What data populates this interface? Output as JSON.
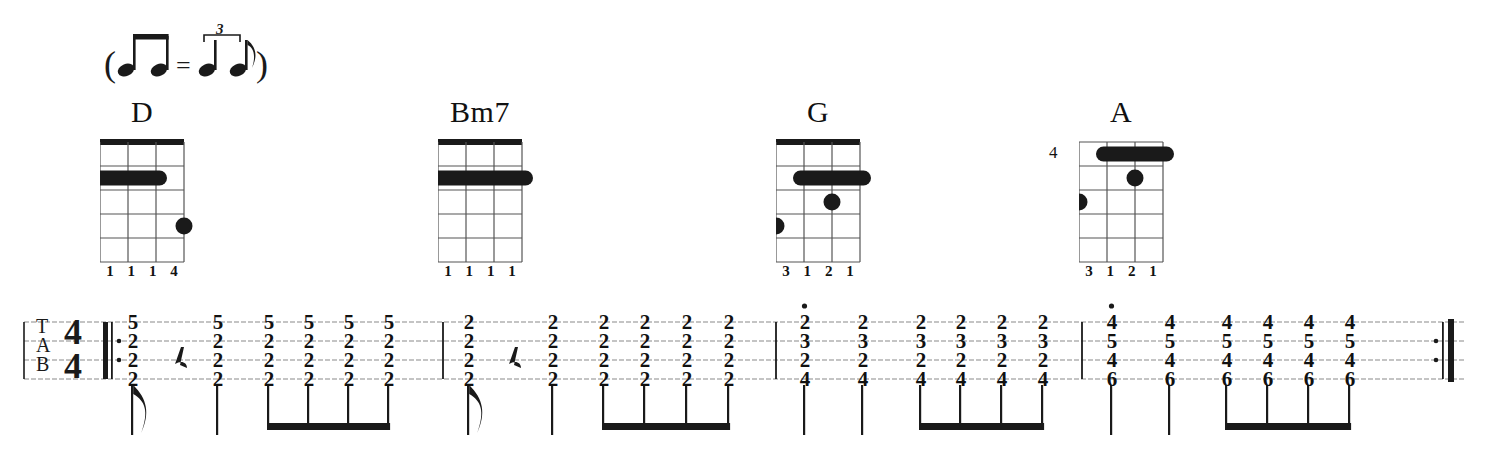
{
  "tempo_marking": {
    "name": "swing-feel-equation",
    "description": "two eighth notes equal quarter-plus-eighth triplet",
    "triplet_number": "3",
    "open_paren": "(",
    "equals": "=",
    "close_paren": ")"
  },
  "chords": [
    {
      "name": "D",
      "x": 86,
      "position_marker": "",
      "has_nut": true,
      "strings": 4,
      "frets": 5,
      "barres": [
        {
          "fret": 2,
          "from_string": 1,
          "to_string": 3
        }
      ],
      "dots": [
        {
          "string": 4,
          "fret": 4
        }
      ],
      "fingering": [
        "1",
        "1",
        "1",
        "4"
      ]
    },
    {
      "name": "Bm7",
      "x": 424,
      "position_marker": "",
      "has_nut": true,
      "strings": 4,
      "frets": 5,
      "barres": [
        {
          "fret": 2,
          "from_string": 1,
          "to_string": 4
        }
      ],
      "dots": [],
      "fingering": [
        "1",
        "1",
        "1",
        "1"
      ]
    },
    {
      "name": "G",
      "x": 762,
      "position_marker": "",
      "has_nut": true,
      "strings": 4,
      "frets": 5,
      "barres": [
        {
          "fret": 2,
          "from_string": 2,
          "to_string": 4
        }
      ],
      "dots": [
        {
          "string": 3,
          "fret": 3
        },
        {
          "string": 1,
          "fret": 4
        }
      ],
      "fingering": [
        "3",
        "1",
        "2",
        "1"
      ]
    },
    {
      "name": "A",
      "x": 1065,
      "position_marker": "4",
      "has_nut": false,
      "strings": 4,
      "frets": 5,
      "barres": [
        {
          "fret": 1,
          "from_string": 2,
          "to_string": 4
        }
      ],
      "dots": [
        {
          "string": 3,
          "fret": 2
        },
        {
          "string": 1,
          "fret": 3
        }
      ],
      "fingering": [
        "3",
        "1",
        "2",
        "1"
      ]
    }
  ],
  "tab": {
    "clef": "TAB",
    "clef_letters": [
      "T",
      "A",
      "B"
    ],
    "time_signature": {
      "numerator": "4",
      "denominator": "4"
    },
    "start_repeat": true,
    "end_repeat": true,
    "string_count": 4,
    "measures": [
      {
        "chord": "D",
        "events": [
          {
            "x": 131,
            "type": "eighth-flag",
            "frets": [
              "5",
              "2",
              "2",
              "2"
            ],
            "staccato": false
          },
          {
            "x": 175,
            "type": "eighth-rest",
            "frets": [],
            "staccato": false
          },
          {
            "x": 216,
            "type": "quarter",
            "frets": [
              "5",
              "2",
              "2",
              "2"
            ],
            "staccato": false
          },
          {
            "x": 267,
            "type": "beamed-eighth",
            "frets": [
              "5",
              "2",
              "2",
              "2"
            ],
            "staccato": false
          },
          {
            "x": 307,
            "type": "beamed-eighth",
            "frets": [
              "5",
              "2",
              "2",
              "2"
            ],
            "staccato": false
          },
          {
            "x": 347,
            "type": "beamed-eighth",
            "frets": [
              "5",
              "2",
              "2",
              "2"
            ],
            "staccato": false
          },
          {
            "x": 387,
            "type": "beamed-eighth",
            "frets": [
              "5",
              "2",
              "2",
              "2"
            ],
            "staccato": false
          }
        ],
        "barline_x": 443
      },
      {
        "chord": "Bm7",
        "events": [
          {
            "x": 467,
            "type": "eighth-flag",
            "frets": [
              "2",
              "2",
              "2",
              "2"
            ],
            "staccato": false
          },
          {
            "x": 509,
            "type": "eighth-rest",
            "frets": [],
            "staccato": false
          },
          {
            "x": 551,
            "type": "quarter",
            "frets": [
              "2",
              "2",
              "2",
              "2"
            ],
            "staccato": false
          },
          {
            "x": 602,
            "type": "beamed-eighth",
            "frets": [
              "2",
              "2",
              "2",
              "2"
            ],
            "staccato": false
          },
          {
            "x": 643,
            "type": "beamed-eighth",
            "frets": [
              "2",
              "2",
              "2",
              "2"
            ],
            "staccato": false
          },
          {
            "x": 685,
            "type": "beamed-eighth",
            "frets": [
              "2",
              "2",
              "2",
              "2"
            ],
            "staccato": false
          },
          {
            "x": 727,
            "type": "beamed-eighth",
            "frets": [
              "2",
              "2",
              "2",
              "2"
            ],
            "staccato": false
          }
        ],
        "barline_x": 776
      },
      {
        "chord": "G",
        "events": [
          {
            "x": 803,
            "type": "quarter",
            "frets": [
              "2",
              "3",
              "2",
              "4"
            ],
            "staccato": true
          },
          {
            "x": 861,
            "type": "quarter",
            "frets": [
              "2",
              "3",
              "2",
              "4"
            ],
            "staccato": false
          },
          {
            "x": 919,
            "type": "beamed-eighth",
            "frets": [
              "2",
              "3",
              "2",
              "4"
            ],
            "staccato": false
          },
          {
            "x": 959,
            "type": "beamed-eighth",
            "frets": [
              "2",
              "3",
              "2",
              "4"
            ],
            "staccato": false
          },
          {
            "x": 1000,
            "type": "beamed-eighth",
            "frets": [
              "2",
              "3",
              "2",
              "4"
            ],
            "staccato": false
          },
          {
            "x": 1041,
            "type": "beamed-eighth",
            "frets": [
              "2",
              "3",
              "2",
              "4"
            ],
            "staccato": false
          }
        ],
        "barline_x": 1082
      },
      {
        "chord": "A",
        "events": [
          {
            "x": 1110,
            "type": "quarter",
            "frets": [
              "4",
              "5",
              "4",
              "6"
            ],
            "staccato": true
          },
          {
            "x": 1168,
            "type": "quarter",
            "frets": [
              "4",
              "5",
              "4",
              "6"
            ],
            "staccato": false
          },
          {
            "x": 1225,
            "type": "beamed-eighth",
            "frets": [
              "4",
              "5",
              "4",
              "6"
            ],
            "staccato": false
          },
          {
            "x": 1266,
            "type": "beamed-eighth",
            "frets": [
              "4",
              "5",
              "4",
              "6"
            ],
            "staccato": false
          },
          {
            "x": 1307,
            "type": "beamed-eighth",
            "frets": [
              "4",
              "5",
              "4",
              "6"
            ],
            "staccato": false
          },
          {
            "x": 1348,
            "type": "beamed-eighth",
            "frets": [
              "4",
              "5",
              "4",
              "6"
            ],
            "staccato": false
          }
        ],
        "barline_x": 1452
      }
    ]
  },
  "colors": {
    "ink": "#1a1a1a",
    "staff_line": "#8a8a8a",
    "paper": "#ffffff"
  }
}
